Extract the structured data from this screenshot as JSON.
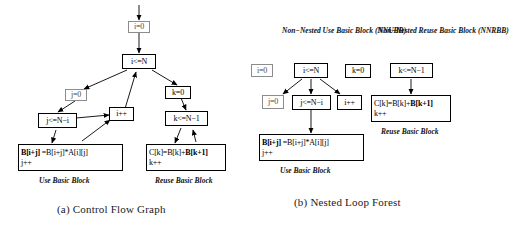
{
  "figure": {
    "panels": [
      {
        "id": "cfg",
        "caption": "(a) Control Flow Graph",
        "nodes": {
          "i_init": "i=0",
          "i_cond": "i<=N",
          "j_init": "j=0",
          "k_init": "k=0",
          "j_cond": "j<=N−i",
          "i_inc": "i++",
          "k_cond": "k<=N−1",
          "use_line1_bold": "B[i+j]",
          "use_line1_rest": " =B[i+j]*A[i][j]",
          "use_line2": "j++",
          "reuse_line1_a": "C[k]=B[k]+",
          "reuse_line1_bold": "B[k+1]",
          "reuse_line2": "k++"
        },
        "labels": {
          "use_block": "Use Basic Block",
          "reuse_block": "Reuse Basic Block"
        }
      },
      {
        "id": "nlf",
        "caption": "(b) Nested Loop Forest",
        "headers": {
          "nnubb": [
            "Non−Nested Use",
            "Basic Block",
            "(NNUBB)"
          ],
          "nnrbb": [
            "Non−Nested Reuse",
            "Basic Block",
            "(NNRBB)"
          ]
        },
        "nodes": {
          "i_init": "i=0",
          "i_cond": "i<=N",
          "k_init": "k=0",
          "k_cond": "k<=N−1",
          "j_init": "j=0",
          "j_cond": "j<=N−i",
          "i_inc": "i++",
          "use_line1_bold": "B[i+j]",
          "use_line1_rest": " =B[i+j]*A[i][j]",
          "use_line2": "j++",
          "reuse_line1_a": "C[k]=B[k]+",
          "reuse_line1_bold": "B[k+1]",
          "reuse_line2": "k++"
        },
        "labels": {
          "use_block": "Use Basic Block",
          "reuse_block": "Reuse Basic Block"
        }
      }
    ],
    "colors": {
      "ink": "#000000",
      "thin_border": "#8c8c8c",
      "background": "#ffffff"
    }
  }
}
